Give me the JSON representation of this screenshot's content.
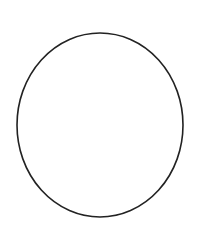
{
  "canvas": {
    "width": 209,
    "height": 249,
    "background": "#ffffff"
  },
  "shapes": [
    {
      "type": "ellipse",
      "cx": 100,
      "cy": 125,
      "rx": 83,
      "ry": 92,
      "stroke": "#222222",
      "stroke_width": 1.6,
      "fill": "none"
    }
  ]
}
